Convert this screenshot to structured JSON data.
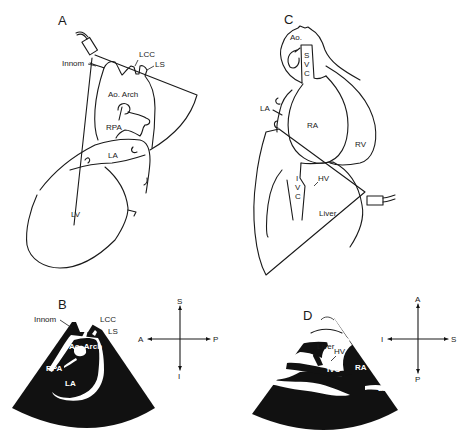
{
  "figure": {
    "panels": [
      {
        "id": "A",
        "type": "anatomical-drawing",
        "view": "suprasternal long-axis transducer placement",
        "labels": {
          "innom": "Innom",
          "lcc": "LCC",
          "ls": "LS",
          "ao_arch": "Ao. Arch",
          "rpa": "RPA",
          "la": "LA",
          "lv": "LV"
        }
      },
      {
        "id": "B",
        "type": "echo-sector",
        "labels": {
          "innom": "Innom",
          "lcc": "LCC",
          "ls": "LS",
          "ao_arch": "Ao. Arch",
          "rpa": "RPA",
          "la": "LA"
        },
        "orientation": {
          "up": "S",
          "down": "I",
          "left": "A",
          "right": "P"
        }
      },
      {
        "id": "C",
        "type": "anatomical-drawing",
        "view": "subcostal transducer placement",
        "labels": {
          "ao": "Ao.",
          "svc_s": "S",
          "svc_v": "V",
          "svc_c": "C",
          "la": "LA",
          "ra": "RA",
          "rv": "RV",
          "ivc_i": "I",
          "ivc_v": "V",
          "ivc_c": "C",
          "hv": "HV",
          "liver": "Liver"
        }
      },
      {
        "id": "D",
        "type": "echo-sector",
        "labels": {
          "liver": "Liver",
          "hv": "HV",
          "ivc": "IVC",
          "ra": "RA",
          "la": "LA"
        },
        "orientation": {
          "up": "A",
          "down": "P",
          "left": "I",
          "right": "S"
        }
      }
    ]
  }
}
